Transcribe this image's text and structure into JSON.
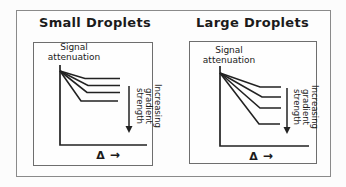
{
  "figure": {
    "background": "#fcfcfc",
    "outer_border_color": "#8a8a8a",
    "plot_border_color": "#6e6e6e",
    "line_color": "#222222",
    "text_color": "#1b1b1b",
    "box": {
      "x": 16,
      "y": 10,
      "w": 315,
      "h": 167
    }
  },
  "panels": [
    {
      "title": "Small Droplets",
      "signal_lines": [
        "Signal",
        "attenuation"
      ],
      "gradient_lines": [
        "Increasing",
        "gradient",
        "strength"
      ],
      "x_symbol": "Δ",
      "x_arrow": "→",
      "geometry": {
        "panel": {
          "x": 16,
          "y": 10,
          "w": 158,
          "h": 167
        },
        "box": {
          "x": 17,
          "y": 32,
          "w": 120,
          "h": 124
        },
        "axes": {
          "x": 44,
          "top": 55,
          "bottom": 135,
          "right": 131
        },
        "fan": {
          "x": 44,
          "y": 61
        },
        "curves": [
          {
            "bend": 69,
            "level": 68.5,
            "end": 104
          },
          {
            "bend": 72,
            "level": 75.5,
            "end": 104
          },
          {
            "bend": 71,
            "level": 82.5,
            "end": 104
          },
          {
            "bend": 65,
            "level": 91,
            "end": 102
          }
        ],
        "arrow": {
          "x": 113,
          "y1": 76,
          "y2": 116,
          "tip": 123
        },
        "signal": {
          "cx": 58,
          "top": 33
        },
        "gradient": {
          "cx": 132,
          "cy": 96
        },
        "delta": {
          "cx": 92,
          "cy": 146
        }
      }
    },
    {
      "title": "Large Droplets",
      "signal_lines": [
        "Signal",
        "attenuation"
      ],
      "gradient_lines": [
        "Increasing",
        "gradient",
        "strength"
      ],
      "x_symbol": "Δ",
      "x_arrow": "→",
      "geometry": {
        "panel": {
          "x": 174,
          "y": 10,
          "w": 157,
          "h": 167
        },
        "box": {
          "x": 15,
          "y": 31,
          "w": 128,
          "h": 123
        },
        "axes": {
          "x": 46,
          "top": 56,
          "bottom": 136,
          "right": 135
        },
        "fan": {
          "x": 46,
          "y": 63
        },
        "curves": [
          {
            "bend": 86,
            "level": 77,
            "end": 107
          },
          {
            "bend": 88,
            "level": 87,
            "end": 107
          },
          {
            "bend": 86,
            "level": 98,
            "end": 107
          },
          {
            "bend": 85,
            "level": 114,
            "end": 106
          }
        ],
        "arrow": {
          "x": 113,
          "y1": 78,
          "y2": 117,
          "tip": 124
        },
        "signal": {
          "cx": 55,
          "top": 36
        },
        "gradient": {
          "cx": 131,
          "cy": 97
        },
        "delta": {
          "cx": 87,
          "cy": 147
        }
      }
    }
  ]
}
